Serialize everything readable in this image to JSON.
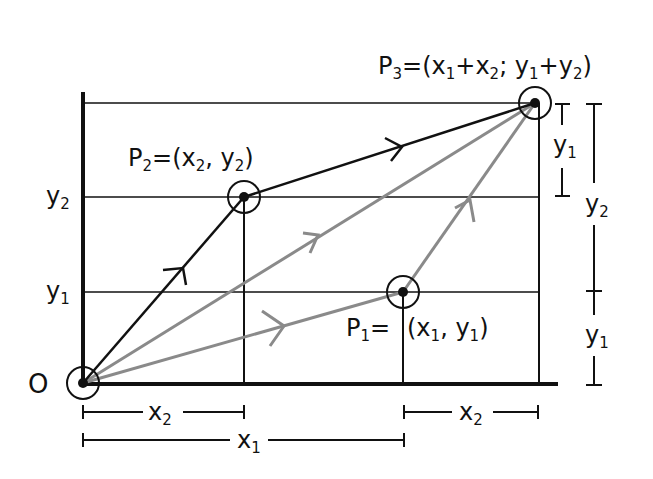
{
  "diagram": {
    "colors": {
      "ink": "#111111",
      "gray_path": "#8a8a8a",
      "background": "#ffffff"
    },
    "origin": {
      "label": "O"
    },
    "points": {
      "P1": {
        "name": "P",
        "sub": "1",
        "eq": "=",
        "coords_open": "(x",
        "coords_sub1": "1",
        "coords_mid": ", y",
        "coords_sub2": "1",
        "coords_close": ")"
      },
      "P2": {
        "name": "P",
        "sub": "2",
        "eq": "=(x",
        "coords_sub1": "2",
        "coords_mid": ", y",
        "coords_sub2": "2",
        "coords_close": ")"
      },
      "P3": {
        "name": "P",
        "sub": "3",
        "eq": "=(x",
        "s1": "1",
        "plus1": "+x",
        "s2": "2",
        "semi": "; y",
        "s3": "1",
        "plus2": "+y",
        "s4": "2",
        "close": ")"
      }
    },
    "y_axis_labels": {
      "y2": {
        "base": "y",
        "sub": "2"
      },
      "y1": {
        "base": "y",
        "sub": "1"
      }
    },
    "x_dimensions": [
      {
        "base": "x",
        "sub": "2",
        "from": "O",
        "to": "x2"
      },
      {
        "base": "x",
        "sub": "2",
        "from": "x1",
        "to": "x1+x2"
      },
      {
        "base": "x",
        "sub": "1",
        "from": "O",
        "to": "x1"
      }
    ],
    "y_dimensions": [
      {
        "base": "y",
        "sub": "1",
        "span": "y2 to y1+y2"
      },
      {
        "base": "y",
        "sub": "2",
        "span": "0 to y2 (outer upper)"
      },
      {
        "base": "y",
        "sub": "1",
        "span": "outer lower"
      }
    ],
    "paths": [
      {
        "name": "O-to-P2",
        "style": "black",
        "arrow": true
      },
      {
        "name": "P2-to-P3",
        "style": "black",
        "arrow": true
      },
      {
        "name": "O-to-P1",
        "style": "gray",
        "arrow": true
      },
      {
        "name": "P1-to-P3",
        "style": "gray",
        "arrow": true
      },
      {
        "name": "O-to-P3",
        "style": "gray",
        "arrow": true
      }
    ]
  }
}
